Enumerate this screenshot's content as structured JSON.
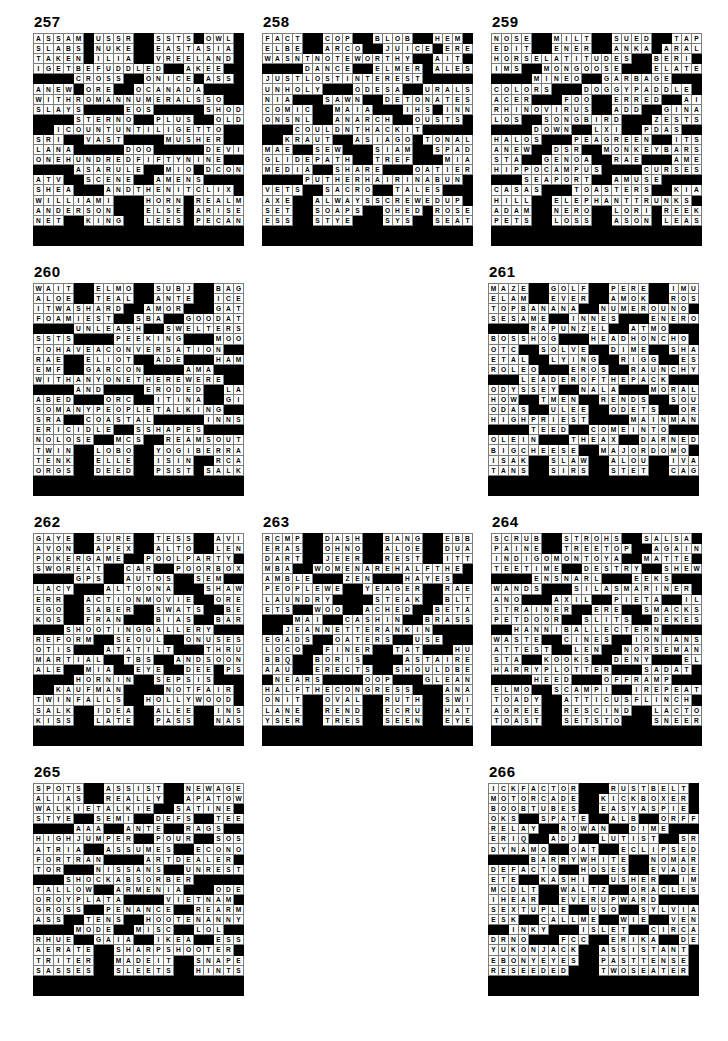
{
  "document": {
    "type": "crossword-answer-key",
    "page_width": 728,
    "page_height": 1041,
    "grid_size": 21,
    "cell_colors": {
      "letter": "#ffffff",
      "block": "#000000",
      "text": "#000000",
      "gridline": "#7d7d7d"
    }
  },
  "puzzles": [
    {
      "number": "257",
      "rows": [
        "ASSAM#USSR##SSTS#OWL#",
        "SLABS#NUKE##EASTASIA#",
        "TAKEN#ILIA##VREELAND#",
        "IGETBEFUDDLED##AKEE##",
        "####CROSS##ONICE#ASS#",
        "ANEW#ORE##OCANADA####",
        "WITHROMANNUMERALSSO##",
        "SLAYS####EOS#####SHOD",
        "####STERNO##PLUS##OLD",
        "##ICOUNTUNTILIGETTO##",
        "SRI##VAST####MUSHER##",
        "LANA#####DOO#####DEVIL",
        "ONEHUNDREDFIFTYNINE##",
        "####ASARULE##MIO#DCON",
        "ATV##SCENE##AMENS####",
        "SHEA###ANDTHENITCLIX#",
        "WILLIAMI###HORN#REALM",
        "ANDERSON###ELSE#ARISE",
        "NET##KING##LEES#PECAN"
      ]
    },
    {
      "number": "258",
      "rows": [
        "FACT##COP##BLOB##HEM#",
        "ELBE##ARCO##JUICE#ERE",
        "WASNTNOTEWORTHY##AIT#",
        "####DANCE##ELMER#ALES",
        "JUSTLOSTINTEREST#####",
        "UNHOLY###ODESA##URALS",
        "NIA###SAWN##DETONATES",
        "COMIC##MAIA###IHS#INN",
        "ONSNL##ANARCH##OUSTS#",
        "###COULDNTHACKIT#####",
        "##KRAUT##ASIAGO#TONAL",
        "MAE##SEW###SIAM##SPADE",
        "GLIDEPATH##TREF###MIA",
        "MEDIA##SHARE###OATIER",
        "####PUTHERHAIRINABUN#",
        "VETS##SACRO##TALES###",
        "AXE##ALWAYSSCREWEDUP#",
        "SET##SOAPS##OHED#ROSE",
        "ESS##STYE###SYS##SEAT"
      ]
    },
    {
      "number": "259",
      "rows": [
        "NOSE##MILT##SUED##TAPE",
        "EDIT##ENER##ANKA#ARAL",
        "HORSELATITUDES##BERI#",
        "IMS##MONGOOSE###ELATE",
        "####MINEO##GARBAGE###",
        "COLORS###DOGGYPADDLE#",
        "ACER###FOO##ERRED##AIR",
        "RHINOVIRUS##ADD##GINA",
        "LOS##SONGBIRD###ZESTS",
        "####DOWN##LXI##PDAS##",
        "HALOS###PEAGREEN##ITS",
        "ANEW##DSR##MONKEYBARS",
        "STA##GENOA##RAE###AMEN",
        "HIPPOCAMPUS####CURSES",
        "###SEAPORT##AMUSE####",
        "CASAS###TOASTERS##KIA",
        "HILL##ELEPHANTTRUNKS#",
        "ADAM##NERO##LORI#REEK",
        "PETS##LOSS##ASON#LEAS"
      ]
    },
    {
      "number": "260",
      "rows": [
        "WAIT##ELMO##SUBJ##BAGS",
        "ALOE##TEAL##ANTE##ICET",
        "ITWASHARD##AMOR###GATE",
        "FOAMIEST##SBA##GOODAT",
        "####UNLEASH##SWELTERS",
        "SSTS####PEEKING###MOO",
        "TOHAVEACONVERSATION##",
        "RAE##ELIOT##ADE###HAMS",
        "EMF##GARCON####AMA###",
        "WITHANYONETHEREWERE##",
        "####AND####ERODED##LAM",
        "ABED###ORC##ITINA##GIA",
        "SOMANYPEOPLETALKING##",
        "SRA##COASTAL#####INNS",
        "ERICIDLE##SSHAPES####",
        "NOLOSE##MCS##REAMSOUT",
        "TWIN##LOBO##YOGIBERRA",
        "TENK##ELLE##ISIN##RCAS",
        "ORGS##DEED##PSST#SALK"
      ]
    },
    {
      "number": "261",
      "rows": [
        "MAZE##GOLF##PERE##IMUS",
        "ELAM##EVER##AMOK##ROSH",
        "TOPBANANA##NUMEROUNO#",
        "SESAME##INNES###ENERO",
        "####RAPUNZEL##ATMO###",
        "BOSSHOG###HEADHONCHO#",
        "OTC##SOLVE##DIME##SHAR",
        "ETAL##LYING##RIGG##ESL",
        "ROLEO###EROS##RAUNCHY",
        "###LEADEROFTHEPACK###",
        "ODYSSEY##NALA###MORAL",
        "HOW##TMEN##RENDS##SOUR",
        "ODAS##ULEE##ODETS##ORO",
        "HIGHPRIEST####MAINMAN",
        "####TEED##COMEINTO###",
        "OLEIN###THEAX##DARNED",
        "BIGCHEESE##MAJORDOMO#",
        "ISAK##SLAW##ALOU##IVAN",
        "TANS##SIRS##STET##CAGE"
      ]
    },
    {
      "number": "262",
      "rows": [
        "GAYE##SURE##TESS##AVIS",
        "AVON##APEX##ALTO##LENT",
        "POKERGAME##POOLPARTY#",
        "SWOREAT##CAR##POORBOX",
        "####GPS##AUTOS##SEM###",
        "LACY###ALTOONA###SHAW",
        "ERR##ACTIONMOVIE##ORE",
        "EGO##SABER##SWATS##BEA",
        "KOS##FRAN###BIAS##BAR",
        "###SHOOTINGGALLERY###",
        "REFORM##SEOUL##ONUSES",
        "OTIS###ATATILT###THRU",
        "MARTIAL##TBS##ANDSOON",
        "ALE##MIA##EYE##DEE#PSS",
        "####HORNIN##SEPSIS###",
        "##KAUFMAN####NOTFAIR#",
        "TWINFALLS##HOLLYWOOD#",
        "SALK##IDEA##ALEE##INSO",
        "KISS##LATE##PASS##NASH"
      ]
    },
    {
      "number": "263",
      "rows": [
        "RCMP##DASH##BANG##EBBS",
        "ERAS##OHNO##ALOE##DUAL",
        "DART##JEER##REST##ITTO",
        "MBA##WOMENAREHALFTHE#",
        "AMBLE###ZEN###HAYES##",
        "PEOPLEWE##YEAGER##RAE",
        "LAUNDRY####STEAK##BLT",
        "ETS##WOO##ACHED##BETA",
        "###MAI##CASHIN##BRASS",
        "##JEANNETTERANKIN####",
        "EGADS##OATERS##USE###",
        "LOCO##FINER##TAT###HUT",
        "BBQ##BORIS####ASTAIRE",
        "AAU##ERECTS##SHOULDBE",
        "#NEARS####OOP###GLEAN",
        "HALFTHECONGRESS###ANA",
        "ONIT##OVAL##RUTH##SWIG",
        "LANE##REND##ECRU##HATE",
        "YSER##TRES##SEEN##EYED"
      ]
    },
    {
      "number": "264",
      "rows": [
        "SCRUB##STROHS##SALSA#",
        "PAINE##TREETOP##AGAIN",
        "INDIGOMONTOYA##MATTE#",
        "TEETIME##DESTRY##SHEW",
        "####ENSNARL###EEKS###",
        "WANDS###SILASMARINER#",
        "ANO###AXIL##PIETA##ILO",
        "STRAINER##ERE##SMACKS",
        "PETDOOR##SLITS##DEKES",
        "##HANNIBALLECTERN####",
        "WASTE##CINES##IONIANS",
        "ATTEST##LEN##NORSEMAN",
        "STA##KOOKS##DENY###ELI",
        "HARRYPLOTTER###SADAT#",
        "####HEED###OFFRAMP###",
        "ELMO##SCAMPI##IREPEAT",
        "TOADY##ATTICUSFLINCH#",
        "AGREE##RESCIND##LACTO",
        "TOAST##SETSTO###SNEER"
      ]
    },
    {
      "number": "265",
      "rows": [
        "SPOTS##ASSIST##NEWAGE",
        "ALIAS##REALLY##APATOW",
        "WALKIETALKIE##SATINE#",
        "STYE##SEMI##DEFS##TEEN",
        "####AAA##ANTE##RAGS###",
        "HIGHJUMPER##POUR##SOS",
        "ATRIA##ASSUMES##ECONO",
        "FORTRAN####ARTDEALER#",
        "TOR###NISSANS##UNREST",
        "###SHOCKABSORBER#####",
        "TALLOW##ARMENIA###ODE",
        "OROYPLATA####VIETNAM#",
        "GROSS##PENANCE##REARM",
        "ASS##TENS##HOOTENANNY",
        "####MODE##MISC##LOL###",
        "RHUE##GAIA##IKEA##ESSO",
        "AERATE##SHARPSHOOTER#",
        "TRITER##MADEIT##SNAPE",
        "SASSES##SLEETS##HINTS"
      ]
    },
    {
      "number": "266",
      "rows": [
        "ICKFACTOR###RUSTBELT#",
        "MOTORCADE##KICKBOXER#",
        "BOOBTUBES##EASYASPIE#",
        "OKS##SPATE##ALB##ORFF",
        "RELAY##ROWAN##DIME###",
        "ERIQ##ADJ##LUTIST##SRA",
        "DYNAMO##OAT##ECLIPSED",
        "####BARRYWHITE##NOMAR",
        "DEFACTO##HOSES##EVADE",
        "ETE##KASHI##USHER##IMP",
        "MCDLT##WALTZ##ORACLES",
        "IHEAR##EVERUPWARD####",
        "SEXTUPLE##USO##SYLVIA",
        "ESK##CALLME##WIE##VEND",
        "##INKY###ISLET##CIRCA",
        "DRNO###FCC##ERIKA##DEP",
        "YUKONJACK##ASSISTANT#",
        "EBONYEYES##PASTTENSE#",
        "RESEEDED###TWOSEATER#"
      ]
    }
  ]
}
